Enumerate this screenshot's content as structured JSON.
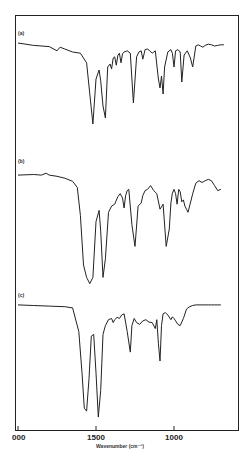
{
  "chart_data": {
    "type": "line",
    "title": "",
    "xlabel": "Wavenumber (cm⁻¹)",
    "ylabel": "",
    "xlim": [
      2000,
      580
    ],
    "x_reversed": true,
    "xticks": [
      2000,
      1500,
      1000
    ],
    "xtick_labels": [
      "000",
      "1500",
      "1000"
    ],
    "grid": false,
    "legend": "none",
    "series": [
      {
        "name": "(a)",
        "label": "(a)",
        "x": [
          2000,
          1900,
          1800,
          1750,
          1730,
          1700,
          1650,
          1600,
          1560,
          1540,
          1520,
          1500,
          1480,
          1470,
          1455,
          1440,
          1425,
          1410,
          1400,
          1390,
          1380,
          1370,
          1360,
          1350,
          1340,
          1330,
          1320,
          1300,
          1280,
          1260,
          1240,
          1225,
          1210,
          1200,
          1185,
          1170,
          1155,
          1140,
          1120,
          1100,
          1090,
          1080,
          1070,
          1060,
          1040,
          1020,
          1010,
          1000,
          990,
          975,
          960,
          950,
          935,
          915,
          895,
          880,
          860,
          845,
          830,
          815,
          800,
          780,
          760,
          740,
          720,
          700,
          680
        ],
        "y": [
          0.95,
          0.91,
          0.89,
          0.82,
          0.88,
          0.85,
          0.8,
          0.78,
          0.62,
          0.1,
          -0.4,
          0.35,
          0.5,
          0.32,
          -0.1,
          -0.3,
          0.55,
          0.6,
          0.52,
          0.7,
          0.72,
          0.58,
          0.74,
          0.78,
          0.62,
          0.77,
          0.8,
          0.82,
          0.78,
          -0.05,
          0.72,
          0.8,
          0.82,
          0.68,
          0.84,
          0.85,
          0.82,
          0.78,
          0.82,
          0.35,
          0.2,
          0.4,
          0.1,
          0.55,
          0.8,
          0.84,
          0.78,
          0.55,
          0.82,
          0.84,
          0.8,
          0.3,
          0.75,
          0.82,
          0.7,
          0.55,
          0.9,
          0.92,
          0.9,
          0.88,
          0.91,
          0.93,
          0.92,
          0.9,
          0.91,
          0.92,
          0.92
        ]
      },
      {
        "name": "(b)",
        "label": "(b)",
        "x": [
          2000,
          1900,
          1850,
          1820,
          1800,
          1750,
          1700,
          1650,
          1620,
          1600,
          1580,
          1560,
          1540,
          1520,
          1500,
          1480,
          1470,
          1455,
          1440,
          1420,
          1400,
          1380,
          1360,
          1345,
          1330,
          1320,
          1310,
          1300,
          1290,
          1270,
          1250,
          1230,
          1210,
          1200,
          1185,
          1170,
          1150,
          1130,
          1110,
          1090,
          1070,
          1050,
          1030,
          1020,
          1010,
          1000,
          990,
          980,
          970,
          960,
          950,
          940,
          930,
          920,
          910,
          895,
          880,
          860,
          840,
          820,
          800,
          780,
          760,
          740,
          720,
          700
        ],
        "y": [
          0.95,
          0.96,
          0.95,
          0.98,
          0.95,
          0.93,
          0.9,
          0.85,
          0.75,
          0.3,
          -0.5,
          -0.7,
          -0.8,
          -0.7,
          0.2,
          0.38,
          0.05,
          -0.7,
          -0.4,
          0.35,
          0.45,
          0.48,
          0.6,
          0.65,
          0.58,
          0.42,
          0.62,
          0.7,
          0.72,
          0.15,
          -0.2,
          0.45,
          0.5,
          0.62,
          0.7,
          0.72,
          0.78,
          0.7,
          0.65,
          0.4,
          0.48,
          -0.2,
          0.08,
          0.5,
          0.66,
          0.72,
          0.65,
          0.48,
          0.72,
          0.68,
          0.52,
          0.55,
          0.45,
          0.4,
          0.35,
          0.5,
          0.65,
          0.82,
          0.86,
          0.83,
          0.86,
          0.88,
          0.86,
          0.78,
          0.7,
          0.72
        ]
      },
      {
        "name": "(c)",
        "label": "(c)",
        "x": [
          2000,
          1900,
          1800,
          1700,
          1650,
          1610,
          1590,
          1575,
          1560,
          1545,
          1530,
          1515,
          1500,
          1485,
          1470,
          1455,
          1440,
          1420,
          1400,
          1390,
          1380,
          1365,
          1350,
          1335,
          1320,
          1300,
          1280,
          1270,
          1255,
          1240,
          1220,
          1200,
          1180,
          1160,
          1140,
          1120,
          1110,
          1100,
          1090,
          1080,
          1070,
          1055,
          1040,
          1020,
          1010,
          1000,
          990,
          975,
          960,
          940,
          920,
          900,
          880,
          860,
          840,
          820,
          800,
          780,
          760,
          740,
          720,
          700
        ],
        "y": [
          0.95,
          0.94,
          0.93,
          0.92,
          0.9,
          0.5,
          -0.2,
          -0.8,
          -0.85,
          -0.3,
          0.42,
          0.45,
          -0.2,
          -0.95,
          -0.5,
          0.45,
          0.6,
          0.7,
          0.72,
          0.65,
          0.7,
          0.74,
          0.72,
          0.78,
          0.8,
          0.5,
          0.15,
          0.6,
          0.72,
          0.65,
          0.62,
          0.68,
          0.7,
          0.66,
          0.65,
          0.55,
          0.7,
          0.3,
          0.0,
          0.6,
          0.8,
          0.82,
          0.78,
          0.7,
          0.75,
          0.72,
          0.68,
          0.62,
          0.6,
          0.72,
          0.88,
          0.92,
          0.94,
          0.95,
          0.95,
          0.95,
          0.95,
          0.95,
          0.95,
          0.95,
          0.95,
          0.95
        ]
      }
    ]
  }
}
